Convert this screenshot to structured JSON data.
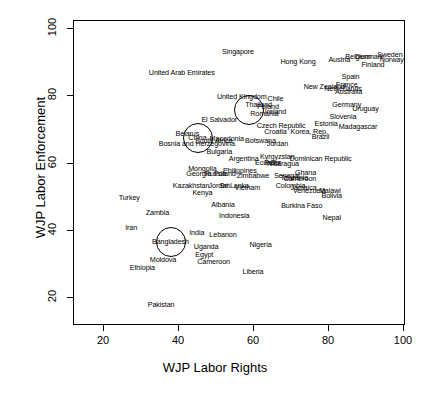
{
  "chart_data": {
    "type": "scatter",
    "title": "",
    "xlabel": "WJP Labor Rights",
    "ylabel": "WJP Labor Enforcement",
    "xlim": [
      11,
      104
    ],
    "ylim": [
      12,
      104
    ],
    "xticks": [
      20,
      40,
      60,
      80,
      100
    ],
    "yticks": [
      20,
      40,
      60,
      80,
      100
    ],
    "grid": false,
    "legend": false,
    "marker_style": "text-label",
    "highlight_circles": [
      {
        "label": "China",
        "x": 45.2,
        "y": 67.3,
        "r_px": 14
      },
      {
        "label": "Thailand-cluster",
        "x": 58.9,
        "y": 75.6,
        "r_px": 14
      },
      {
        "label": "Bangladesh",
        "x": 38.0,
        "y": 36.3,
        "r_px": 14
      }
    ],
    "points": [
      {
        "label": "Singapore",
        "x": 56.0,
        "y": 93.0
      },
      {
        "label": "Hong Kong",
        "x": 72.0,
        "y": 90.0
      },
      {
        "label": "Austria",
        "x": 83.0,
        "y": 90.5
      },
      {
        "label": "Belgium",
        "x": 88.0,
        "y": 91.5
      },
      {
        "label": "Denmark",
        "x": 91.0,
        "y": 91.5
      },
      {
        "label": "Sweden",
        "x": 96.5,
        "y": 92.0
      },
      {
        "label": "Norway",
        "x": 97.0,
        "y": 90.5
      },
      {
        "label": "Finland",
        "x": 92.0,
        "y": 89.0
      },
      {
        "label": "United Arab Emirates",
        "x": 41.0,
        "y": 86.5
      },
      {
        "label": "Spain",
        "x": 86.0,
        "y": 85.5
      },
      {
        "label": "New Zealand",
        "x": 79.0,
        "y": 82.5
      },
      {
        "label": "France",
        "x": 85.0,
        "y": 83.0
      },
      {
        "label": "Netherlands",
        "x": 84.0,
        "y": 82.0
      },
      {
        "label": "Australia",
        "x": 85.5,
        "y": 81.0
      },
      {
        "label": "United Kingdom",
        "x": 57.0,
        "y": 79.5
      },
      {
        "label": "Chile",
        "x": 66.0,
        "y": 79.0
      },
      {
        "label": "Thailand",
        "x": 61.5,
        "y": 77.0
      },
      {
        "label": "Poland",
        "x": 64.0,
        "y": 76.5
      },
      {
        "label": "Germany",
        "x": 85.0,
        "y": 77.0
      },
      {
        "label": "Uruguay",
        "x": 90.0,
        "y": 76.0
      },
      {
        "label": "Romania",
        "x": 63.0,
        "y": 74.5
      },
      {
        "label": "Ireland",
        "x": 66.0,
        "y": 75.0
      },
      {
        "label": "Slovenia",
        "x": 84.0,
        "y": 73.5
      },
      {
        "label": "El Salvador",
        "x": 51.0,
        "y": 72.5
      },
      {
        "label": "Czech Republic",
        "x": 67.5,
        "y": 71.0
      },
      {
        "label": "Estonia",
        "x": 79.5,
        "y": 71.5
      },
      {
        "label": "Madagascar",
        "x": 88.0,
        "y": 70.5
      },
      {
        "label": "Croatia",
        "x": 66.0,
        "y": 69.0
      },
      {
        "label": "Korea, Rep.",
        "x": 75.0,
        "y": 69.0
      },
      {
        "label": "Belarus",
        "x": 42.5,
        "y": 68.5
      },
      {
        "label": "Brazil",
        "x": 78.0,
        "y": 67.5
      },
      {
        "label": "China",
        "x": 45.2,
        "y": 67.3
      },
      {
        "label": "Macedonia",
        "x": 53.0,
        "y": 67.0
      },
      {
        "label": "South Africa",
        "x": 49.5,
        "y": 66.5
      },
      {
        "label": "Botswana",
        "x": 62.0,
        "y": 66.5
      },
      {
        "label": "Bosnia and Herzegovina",
        "x": 45.0,
        "y": 65.5
      },
      {
        "label": "Jordan",
        "x": 66.5,
        "y": 65.5
      },
      {
        "label": "Bulgaria",
        "x": 51.0,
        "y": 63.0
      },
      {
        "label": "Kyrgyzstan",
        "x": 66.5,
        "y": 61.5
      },
      {
        "label": "Dominican Republic",
        "x": 78.0,
        "y": 61.0
      },
      {
        "label": "Argentina",
        "x": 57.5,
        "y": 61.0
      },
      {
        "label": "Peru",
        "x": 65.0,
        "y": 60.0
      },
      {
        "label": "Ecuador",
        "x": 64.0,
        "y": 60.0
      },
      {
        "label": "Nicaragua",
        "x": 68.0,
        "y": 59.5
      },
      {
        "label": "Mongolia",
        "x": 46.5,
        "y": 58.0
      },
      {
        "label": "Philippines",
        "x": 56.5,
        "y": 57.5
      },
      {
        "label": "Ghana",
        "x": 74.0,
        "y": 57.0
      },
      {
        "label": "Georgia",
        "x": 45.5,
        "y": 56.5
      },
      {
        "label": "Russia",
        "x": 50.0,
        "y": 56.5
      },
      {
        "label": "Poland2",
        "x": 52.5,
        "y": 56.5
      },
      {
        "label": "Zimbabwe",
        "x": 60.0,
        "y": 56.0
      },
      {
        "label": "Senegal",
        "x": 69.0,
        "y": 56.0
      },
      {
        "label": "Tanzania",
        "x": 71.0,
        "y": 55.5
      },
      {
        "label": "Cameroon2",
        "x": 72.5,
        "y": 55.0
      },
      {
        "label": "Kazakhstan",
        "x": 43.5,
        "y": 53.0
      },
      {
        "label": "Jordan2",
        "x": 51.0,
        "y": 53.0
      },
      {
        "label": "Sri Lanka",
        "x": 55.0,
        "y": 53.0
      },
      {
        "label": "Vietnam",
        "x": 58.5,
        "y": 52.5
      },
      {
        "label": "Colombia",
        "x": 70.0,
        "y": 53.0
      },
      {
        "label": "Jamaica",
        "x": 73.5,
        "y": 52.5
      },
      {
        "label": "Venezuela",
        "x": 75.0,
        "y": 51.5
      },
      {
        "label": "Kenya",
        "x": 46.5,
        "y": 51.0
      },
      {
        "label": "Malawi",
        "x": 80.5,
        "y": 51.5
      },
      {
        "label": "Bolivia",
        "x": 81.0,
        "y": 50.0
      },
      {
        "label": "Albania",
        "x": 52.0,
        "y": 47.5
      },
      {
        "label": "Burkina Faso",
        "x": 73.0,
        "y": 47.0
      },
      {
        "label": "Turkey",
        "x": 27.0,
        "y": 49.5
      },
      {
        "label": "Zambia",
        "x": 34.5,
        "y": 45.0
      },
      {
        "label": "Indonesia",
        "x": 55.0,
        "y": 44.0
      },
      {
        "label": "Nepal",
        "x": 81.0,
        "y": 43.5
      },
      {
        "label": "Iran",
        "x": 27.5,
        "y": 40.5
      },
      {
        "label": "India",
        "x": 45.0,
        "y": 39.0
      },
      {
        "label": "Lebanon",
        "x": 52.0,
        "y": 38.5
      },
      {
        "label": "Bangladesh",
        "x": 38.0,
        "y": 36.3
      },
      {
        "label": "Uganda",
        "x": 47.5,
        "y": 35.0
      },
      {
        "label": "Nigeria",
        "x": 62.0,
        "y": 35.5
      },
      {
        "label": "Egypt",
        "x": 47.0,
        "y": 32.5
      },
      {
        "label": "Moldova",
        "x": 36.0,
        "y": 31.0
      },
      {
        "label": "Cameroon",
        "x": 49.5,
        "y": 30.5
      },
      {
        "label": "Ethiopia",
        "x": 30.5,
        "y": 28.5
      },
      {
        "label": "Liberia",
        "x": 60.0,
        "y": 27.5
      },
      {
        "label": "Pakistan",
        "x": 35.5,
        "y": 17.5
      }
    ]
  }
}
